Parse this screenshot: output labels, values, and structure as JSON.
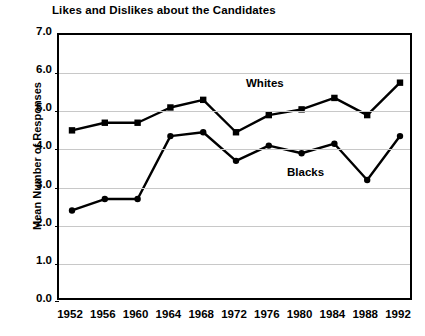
{
  "chart_data": {
    "type": "line",
    "title": "Likes and Dislikes about the Candidates",
    "xlabel": "",
    "ylabel": "Mean Number of Responses",
    "categories": [
      "1952",
      "1956",
      "1960",
      "1964",
      "1968",
      "1972",
      "1976",
      "1980",
      "1984",
      "1988",
      "1992"
    ],
    "x_tick_labels": [
      "1952",
      "1956",
      "1960",
      "1964",
      "1968",
      "1972",
      "1976",
      "1980",
      "1984",
      "1988",
      "1992"
    ],
    "y_tick_labels": [
      "7.0",
      "6.0",
      "5.0",
      "4.0",
      "3.0",
      "2.0",
      "1.0",
      "0.0"
    ],
    "ylim": [
      0.0,
      7.0
    ],
    "y_step": 1.0,
    "grid": true,
    "legend_position": "inline-annotations",
    "series": [
      {
        "name": "Whites",
        "marker": "square",
        "color": "#000000",
        "values": [
          4.5,
          4.7,
          4.7,
          5.1,
          5.3,
          4.45,
          4.9,
          5.05,
          5.35,
          4.9,
          5.75
        ]
      },
      {
        "name": "Blacks",
        "marker": "circle",
        "color": "#000000",
        "values": [
          2.4,
          2.7,
          2.7,
          4.35,
          4.45,
          3.7,
          4.1,
          3.9,
          4.15,
          3.2,
          4.35
        ]
      }
    ],
    "annotations": [
      {
        "text": "Whites",
        "x_px": 246,
        "y_px": 77
      },
      {
        "text": "Blacks",
        "x_px": 287,
        "y_px": 166
      }
    ]
  }
}
